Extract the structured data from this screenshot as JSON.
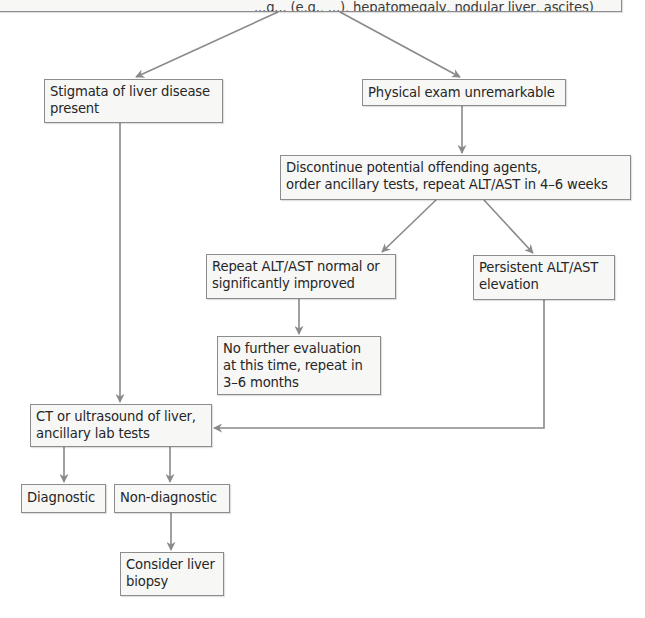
{
  "diagram": {
    "type": "flowchart",
    "colors": {
      "box_fill": "#f7f7f6",
      "box_border": "#8c8c8c",
      "connector": "#8a8a8a",
      "text": "#262626"
    },
    "nodes": {
      "top": {
        "label": "...g... (e.g., ...), hepatomegaly, nodular liver, ascites)",
        "note": "partially cropped at top edge"
      },
      "stigmata": {
        "label": "Stigmata of liver disease\npresent"
      },
      "physical": {
        "label": "Physical exam unremarkable"
      },
      "discontinue": {
        "label": "Discontinue potential offending agents,\norder ancillary tests, repeat ALT/AST in 4–6 weeks"
      },
      "repeat": {
        "label": "Repeat ALT/AST normal or\nsignificantly improved"
      },
      "persistent": {
        "label": "Persistent ALT/AST\nelevation"
      },
      "nofurther": {
        "label": "No further evaluation\nat this time, repeat in\n3–6 months"
      },
      "ct": {
        "label": "CT or ultrasound of liver,\nancillary lab tests"
      },
      "diagnostic": {
        "label": "Diagnostic"
      },
      "nondiagnostic": {
        "label": "Non-diagnostic"
      },
      "consider": {
        "label": "Consider liver\nbiopsy"
      }
    },
    "edges": [
      {
        "from": "top",
        "to": "stigmata"
      },
      {
        "from": "top",
        "to": "physical"
      },
      {
        "from": "physical",
        "to": "discontinue"
      },
      {
        "from": "discontinue",
        "to": "repeat"
      },
      {
        "from": "discontinue",
        "to": "persistent"
      },
      {
        "from": "repeat",
        "to": "nofurther"
      },
      {
        "from": "stigmata",
        "to": "ct"
      },
      {
        "from": "persistent",
        "to": "ct"
      },
      {
        "from": "ct",
        "to": "diagnostic"
      },
      {
        "from": "ct",
        "to": "nondiagnostic"
      },
      {
        "from": "nondiagnostic",
        "to": "consider"
      }
    ]
  }
}
